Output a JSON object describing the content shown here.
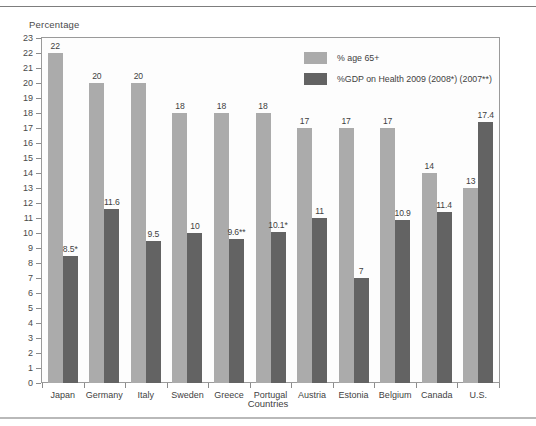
{
  "axis": {
    "y_title": "Percentage",
    "x_title": "Countries"
  },
  "legend": {
    "items": [
      {
        "label": "% age 65+",
        "color": "#ababab",
        "key": "age65"
      },
      {
        "label": "%GDP on Health 2009 (2008*) (2007**)",
        "color": "#636363",
        "key": "gdp"
      }
    ]
  },
  "chart_data": {
    "type": "bar",
    "title": "",
    "xlabel": "Countries",
    "ylabel": "Percentage",
    "ylim": [
      0,
      23
    ],
    "ytick_step": 1,
    "yticks": [
      0,
      1,
      2,
      3,
      4,
      5,
      6,
      7,
      8,
      9,
      10,
      11,
      12,
      13,
      14,
      15,
      16,
      17,
      18,
      19,
      20,
      21,
      22,
      23
    ],
    "grid": false,
    "legend_position": "top-right-inside",
    "categories": [
      "Japan",
      "Germany",
      "Italy",
      "Sweden",
      "Greece",
      "Portugal",
      "Austria",
      "Estonia",
      "Belgium",
      "Canada",
      "U.S."
    ],
    "series": [
      {
        "name": "% age 65+",
        "color": "#ababab",
        "values": [
          22,
          20,
          20,
          18,
          18,
          18,
          17,
          17,
          17,
          14,
          13
        ],
        "labels": [
          "22",
          "20",
          "20",
          "18",
          "18",
          "18",
          "17",
          "17",
          "17",
          "14",
          "13"
        ]
      },
      {
        "name": "%GDP on Health 2009 (2008*) (2007**)",
        "color": "#636363",
        "values": [
          8.5,
          11.6,
          9.5,
          10,
          9.6,
          10.1,
          11,
          7,
          10.9,
          11.4,
          17.4
        ],
        "labels": [
          "8.5*",
          "11.6",
          "9.5",
          "10",
          "9.6**",
          "10.1*",
          "11",
          "7",
          "10.9",
          "11.4",
          "17.4"
        ]
      }
    ]
  }
}
